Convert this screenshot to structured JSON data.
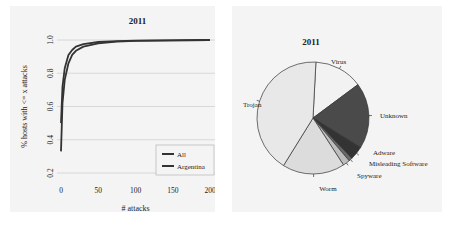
{
  "chart_data": [
    {
      "type": "line",
      "title": "2011",
      "xlabel": "# attacks",
      "ylabel": "% hosts with <= x attacks",
      "xlim": [
        0,
        200
      ],
      "ylim": [
        0.2,
        1.0
      ],
      "xticks": [
        "0",
        "50",
        "100",
        "150",
        "200"
      ],
      "yticks": [
        "0.2",
        "0.4",
        "0.6",
        "0.8",
        "1.0"
      ],
      "grid": true,
      "legend_position": "lower right",
      "series": [
        {
          "name": "All",
          "x": [
            0,
            2,
            5,
            10,
            15,
            20,
            30,
            50,
            75,
            100,
            150,
            200
          ],
          "values": [
            0.5,
            0.72,
            0.83,
            0.91,
            0.94,
            0.96,
            0.975,
            0.988,
            0.993,
            0.996,
            0.998,
            1.0
          ]
        },
        {
          "name": "Argentina",
          "x": [
            0,
            2,
            5,
            10,
            15,
            20,
            30,
            50,
            75,
            100,
            150,
            200
          ],
          "values": [
            0.33,
            0.62,
            0.76,
            0.86,
            0.91,
            0.935,
            0.96,
            0.98,
            0.99,
            0.995,
            0.998,
            1.0
          ]
        }
      ]
    },
    {
      "type": "pie",
      "title": "2011",
      "categories": [
        "Virus",
        "Unknown",
        "Adware",
        "Misleading Software",
        "Spyware",
        "Worm",
        "Trojan"
      ],
      "values": [
        14,
        19,
        4,
        1,
        2,
        18,
        42
      ],
      "colors": [
        "#f2f2f2",
        "#4a4a4a",
        "#333333",
        "#6a6a6a",
        "#bdbdbd",
        "#dcdcdc",
        "#e8e8e8"
      ]
    }
  ]
}
